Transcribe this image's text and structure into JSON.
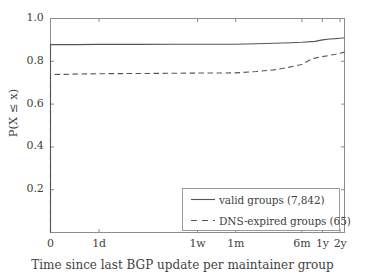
{
  "chart_data": {
    "type": "line",
    "title": "",
    "xlabel": "Time since last BGP update per maintainer group",
    "ylabel": "P(X ≤ x)",
    "ylim": [
      0.0,
      1.0
    ],
    "grid": false,
    "legend_position": "lower right",
    "y_ticks": [
      "1.0",
      "0.8",
      "0.6",
      "0.4",
      "0.2"
    ],
    "y_tick_values": [
      1.0,
      0.8,
      0.6,
      0.4,
      0.2
    ],
    "x_ticks": [
      "0",
      "1d",
      "1w",
      "1m",
      "6m",
      "1y",
      "2y"
    ],
    "x_tick_positions": [
      0.0,
      0.165,
      0.5,
      0.63,
      0.855,
      0.925,
      0.985
    ],
    "series": [
      {
        "name": "valid groups (7,842)",
        "style": "solid",
        "color": "#555555",
        "x": [
          0.0,
          0.0,
          0.08,
          0.165,
          0.3,
          0.42,
          0.5,
          0.56,
          0.63,
          0.7,
          0.76,
          0.82,
          0.855,
          0.9,
          0.925,
          0.95,
          0.97,
          0.985,
          1.0
        ],
        "y": [
          0.0,
          0.878,
          0.878,
          0.879,
          0.879,
          0.88,
          0.88,
          0.88,
          0.88,
          0.882,
          0.884,
          0.887,
          0.889,
          0.893,
          0.9,
          0.904,
          0.906,
          0.908,
          0.91
        ]
      },
      {
        "name": "DNS-expired groups (65)",
        "style": "dashed",
        "color": "#555555",
        "x": [
          0.0,
          0.0,
          0.08,
          0.165,
          0.3,
          0.42,
          0.5,
          0.56,
          0.63,
          0.7,
          0.76,
          0.8,
          0.83,
          0.855,
          0.88,
          0.9,
          0.925,
          0.95,
          0.97,
          0.985,
          1.0
        ],
        "y": [
          0.0,
          0.738,
          0.74,
          0.742,
          0.743,
          0.744,
          0.745,
          0.745,
          0.746,
          0.752,
          0.76,
          0.769,
          0.778,
          0.785,
          0.805,
          0.815,
          0.822,
          0.828,
          0.833,
          0.838,
          0.843
        ]
      }
    ]
  },
  "legend": {
    "entries": [
      {
        "label": "valid groups (7,842)",
        "style": "solid"
      },
      {
        "label": "DNS-expired groups (65)",
        "style": "dashed"
      }
    ]
  },
  "colors": {
    "line": "#555555",
    "axis": "#8c8c8c",
    "text": "#3f3f3f",
    "background": "#ffffff"
  }
}
